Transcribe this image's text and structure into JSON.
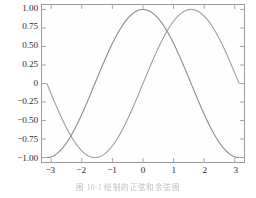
{
  "figure": {
    "caption": "图 10-1   绘制的正弦和余弦图",
    "background_color": "#ffffff",
    "frame_color": "#9a9a9a"
  },
  "chart_data": {
    "type": "line",
    "title": "",
    "xlabel": "",
    "ylabel": "",
    "xlim": [
      -3.3,
      3.3
    ],
    "ylim": [
      -1.06,
      1.06
    ],
    "grid": false,
    "legend": null,
    "xticks": [
      -3,
      -2,
      -1,
      0,
      1,
      2,
      3
    ],
    "xticklabels": [
      "−3",
      "−2",
      "−1",
      "0",
      "1",
      "2",
      "3"
    ],
    "yticks": [
      1.0,
      0.75,
      0.5,
      0.25,
      0,
      -0.25,
      -0.5,
      -0.75,
      -1.0
    ],
    "yticklabels": [
      "1.00",
      "0.75",
      "0.50",
      "0.25",
      "0",
      "−0.25",
      "−0.50",
      "−0.75",
      "−1.00"
    ],
    "x": [
      -3.14159,
      -2.9452,
      -2.74889,
      -2.55259,
      -2.35619,
      -2.15984,
      -1.9635,
      -1.76715,
      -1.5708,
      -1.37445,
      -1.1781,
      -0.98175,
      -0.7854,
      -0.58905,
      -0.3927,
      -0.19635,
      0,
      0.19635,
      0.3927,
      0.58905,
      0.7854,
      0.98175,
      1.1781,
      1.37445,
      1.5708,
      1.76715,
      1.9635,
      2.15984,
      2.35619,
      2.55259,
      2.74889,
      2.9452,
      3.14159
    ],
    "series": [
      {
        "name": "cos(x)",
        "color": "#8a8a8a",
        "linewidth": 1.1,
        "values": [
          -1.0,
          -0.98079,
          -0.92388,
          -0.83147,
          -0.70711,
          -0.55557,
          -0.38268,
          -0.19509,
          0.0,
          0.19509,
          0.38268,
          0.55557,
          0.70711,
          0.83147,
          0.92388,
          0.98079,
          1.0,
          0.98079,
          0.92388,
          0.83147,
          0.70711,
          0.55557,
          0.38268,
          0.19509,
          0.0,
          -0.19509,
          -0.38268,
          -0.55557,
          -0.70711,
          -0.83147,
          -0.92388,
          -0.98079,
          -1.0
        ]
      },
      {
        "name": "sin(x)",
        "color": "#9d9d9d",
        "linewidth": 1.1,
        "values": [
          0.0,
          -0.19509,
          -0.38268,
          -0.55557,
          -0.70711,
          -0.83147,
          -0.92388,
          -0.98079,
          -1.0,
          -0.98079,
          -0.92388,
          -0.83147,
          -0.70711,
          -0.55557,
          -0.38268,
          -0.19509,
          0.0,
          0.19509,
          0.38268,
          0.55557,
          0.70711,
          0.83147,
          0.92388,
          0.98079,
          1.0,
          0.98079,
          0.92388,
          0.83147,
          0.70711,
          0.55557,
          0.38268,
          0.19509,
          0.0
        ]
      }
    ]
  }
}
